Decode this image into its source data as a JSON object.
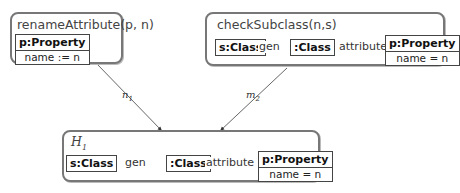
{
  "rules": [
    {
      "title": "renameAttribute(p, n)",
      "nodes": [
        {
          "name": "p:Property",
          "attribute": "name := n"
        }
      ]
    },
    {
      "title": "checkSubclass(n,s)",
      "nodes": [
        {
          "name": "s:Class"
        },
        {
          "name": ":Class"
        },
        {
          "name": "p:Property",
          "attribute": "name = n"
        }
      ],
      "edges": [
        {
          "label": "gen",
          "from": ":Class",
          "to": "s:Class"
        },
        {
          "label": "attribute",
          "from": ":Class",
          "to": "p:Property"
        }
      ]
    },
    {
      "title": "H1",
      "nodes": [
        {
          "name": "s:Class"
        },
        {
          "name": ":Class"
        },
        {
          "name": "p:Property",
          "attribute": "name = n"
        }
      ],
      "edges": [
        {
          "label": "gen",
          "from": ":Class",
          "to": "s:Class"
        },
        {
          "label": "attribute",
          "from": ":Class",
          "to": "p:Property"
        }
      ]
    }
  ],
  "morphisms": [
    {
      "label": "n1",
      "from": "renameAttribute(p, n)",
      "to": "H1"
    },
    {
      "label": "m2",
      "from": "checkSubclass(n,s)",
      "to": "H1"
    }
  ],
  "h1_title": {
    "base": "H",
    "sub": "1"
  },
  "m_labels": {
    "n1": {
      "base": "n",
      "sub": "1"
    },
    "m2": {
      "base": "m",
      "sub": "2"
    }
  }
}
